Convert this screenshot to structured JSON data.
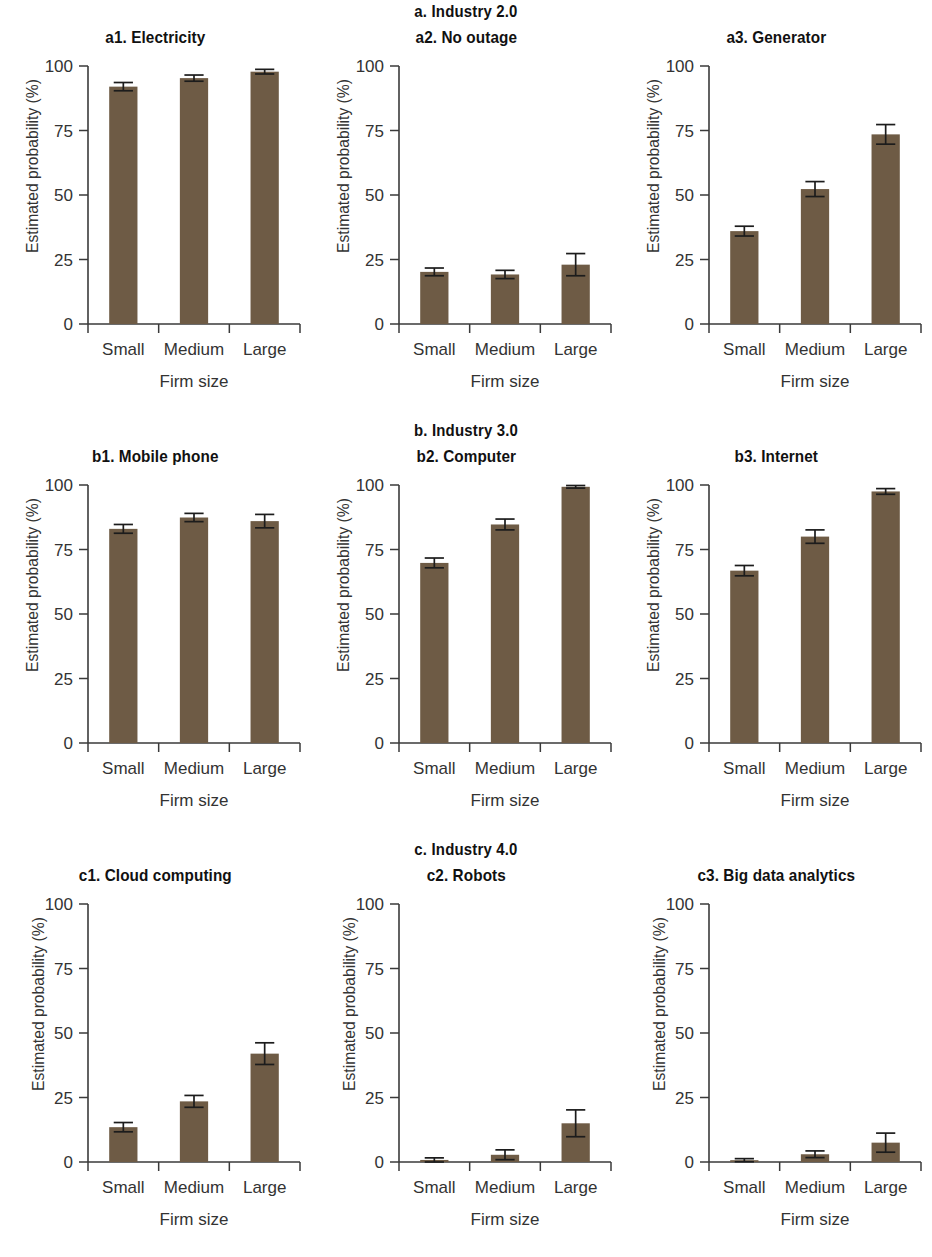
{
  "figure": {
    "axis_labels": {
      "y": "Estimated probability (%)",
      "x": "Firm size"
    },
    "y_ticks": [
      "0",
      "25",
      "50",
      "75",
      "100"
    ],
    "categories": [
      "Small",
      "Medium",
      "Large"
    ],
    "bar_color": "#6e5b45",
    "axis_color": "#3a3a3a",
    "error_color": "#1c1c1c"
  },
  "groups": [
    {
      "title": "a. Industry 2.0",
      "panels": [
        {
          "title": "a1. Electricity"
        },
        {
          "title": "a2. No outage"
        },
        {
          "title": "a3. Generator"
        }
      ]
    },
    {
      "title": "b. Industry 3.0",
      "panels": [
        {
          "title": "b1. Mobile phone"
        },
        {
          "title": "b2. Computer"
        },
        {
          "title": "b3. Internet"
        }
      ]
    },
    {
      "title": "c. Industry 4.0",
      "panels": [
        {
          "title": "c1. Cloud computing"
        },
        {
          "title": "c2. Robots"
        },
        {
          "title": "c3. Big data analytics"
        }
      ]
    }
  ],
  "chart_data": [
    {
      "type": "bar",
      "id": "a1",
      "title": "a1. Electricity",
      "group": "a. Industry 2.0",
      "xlabel": "Firm size",
      "ylabel": "Estimated probability (%)",
      "ylim": [
        0,
        100
      ],
      "yticks": [
        0,
        25,
        50,
        75,
        100
      ],
      "grid": false,
      "legend": "none",
      "categories": [
        "Small",
        "Medium",
        "Large"
      ],
      "values": [
        92.0,
        95.3,
        97.8
      ],
      "errors": [
        1.6,
        1.2,
        0.9
      ]
    },
    {
      "type": "bar",
      "id": "a2",
      "title": "a2. No outage",
      "group": "a. Industry 2.0",
      "xlabel": "Firm size",
      "ylabel": "Estimated probability (%)",
      "ylim": [
        0,
        100
      ],
      "yticks": [
        0,
        25,
        50,
        75,
        100
      ],
      "grid": false,
      "legend": "none",
      "categories": [
        "Small",
        "Medium",
        "Large"
      ],
      "values": [
        20.2,
        19.2,
        23.0
      ],
      "errors": [
        1.5,
        1.6,
        4.3
      ]
    },
    {
      "type": "bar",
      "id": "a3",
      "title": "a3. Generator",
      "group": "a. Industry 2.0",
      "xlabel": "Firm size",
      "ylabel": "Estimated probability (%)",
      "ylim": [
        0,
        100
      ],
      "yticks": [
        0,
        25,
        50,
        75,
        100
      ],
      "grid": false,
      "legend": "none",
      "categories": [
        "Small",
        "Medium",
        "Large"
      ],
      "values": [
        36.0,
        52.3,
        73.5
      ],
      "errors": [
        1.9,
        2.9,
        3.8
      ]
    },
    {
      "type": "bar",
      "id": "b1",
      "title": "b1. Mobile phone",
      "group": "b. Industry 3.0",
      "xlabel": "Firm size",
      "ylabel": "Estimated probability (%)",
      "ylim": [
        0,
        100
      ],
      "yticks": [
        0,
        25,
        50,
        75,
        100
      ],
      "grid": false,
      "legend": "none",
      "categories": [
        "Small",
        "Medium",
        "Large"
      ],
      "values": [
        83.0,
        87.4,
        86.0
      ],
      "errors": [
        1.7,
        1.6,
        2.6
      ]
    },
    {
      "type": "bar",
      "id": "b2",
      "title": "b2. Computer",
      "group": "b. Industry 3.0",
      "xlabel": "Firm size",
      "ylabel": "Estimated probability (%)",
      "ylim": [
        0,
        100
      ],
      "yticks": [
        0,
        25,
        50,
        75,
        100
      ],
      "grid": false,
      "legend": "none",
      "categories": [
        "Small",
        "Medium",
        "Large"
      ],
      "values": [
        69.8,
        84.7,
        99.3
      ],
      "errors": [
        1.9,
        2.1,
        0.5
      ]
    },
    {
      "type": "bar",
      "id": "b3",
      "title": "b3. Internet",
      "group": "b. Industry 3.0",
      "xlabel": "Firm size",
      "ylabel": "Estimated probability (%)",
      "ylim": [
        0,
        100
      ],
      "yticks": [
        0,
        25,
        50,
        75,
        100
      ],
      "grid": false,
      "legend": "none",
      "categories": [
        "Small",
        "Medium",
        "Large"
      ],
      "values": [
        66.8,
        80.0,
        97.5
      ],
      "errors": [
        2.0,
        2.6,
        1.1
      ]
    },
    {
      "type": "bar",
      "id": "c1",
      "title": "c1. Cloud computing",
      "group": "c. Industry 4.0",
      "xlabel": "Firm size",
      "ylabel": "Estimated probability (%)",
      "ylim": [
        0,
        100
      ],
      "yticks": [
        0,
        25,
        50,
        75,
        100
      ],
      "grid": false,
      "legend": "none",
      "categories": [
        "Small",
        "Medium",
        "Large"
      ],
      "values": [
        13.5,
        23.5,
        42.0
      ],
      "errors": [
        1.8,
        2.3,
        4.2
      ]
    },
    {
      "type": "bar",
      "id": "c2",
      "title": "c2. Robots",
      "group": "c. Industry 4.0",
      "xlabel": "Firm size",
      "ylabel": "Estimated probability (%)",
      "ylim": [
        0,
        100
      ],
      "yticks": [
        0,
        25,
        50,
        75,
        100
      ],
      "grid": false,
      "legend": "none",
      "categories": [
        "Small",
        "Medium",
        "Large"
      ],
      "values": [
        0.8,
        2.8,
        15.0
      ],
      "errors": [
        0.8,
        1.9,
        5.2
      ]
    },
    {
      "type": "bar",
      "id": "c3",
      "title": "c3. Big data analytics",
      "group": "c. Industry 4.0",
      "xlabel": "Firm size",
      "ylabel": "Estimated probability (%)",
      "ylim": [
        0,
        100
      ],
      "yticks": [
        0,
        25,
        50,
        75,
        100
      ],
      "grid": false,
      "legend": "none",
      "categories": [
        "Small",
        "Medium",
        "Large"
      ],
      "values": [
        0.7,
        3.0,
        7.5
      ],
      "errors": [
        0.6,
        1.3,
        3.7
      ]
    }
  ]
}
